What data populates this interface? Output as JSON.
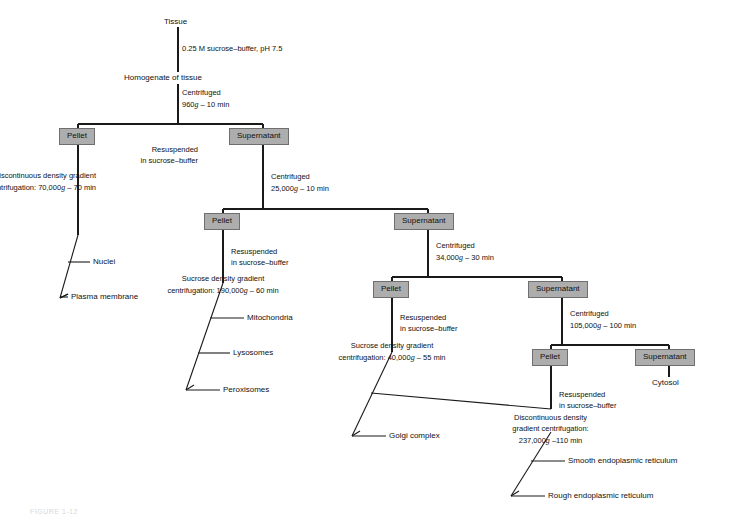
{
  "diagram": {
    "colors": {
      "box_fill": "#adadad",
      "box_border": "#6f6f6f",
      "line": "#1a1a1a",
      "text": "#111111",
      "background": "#ffffff"
    },
    "start_label": "Tissue",
    "homogenate_label": "Homogenate of tissue",
    "box_labels": {
      "pellet": "Pellet",
      "supernatant": "Supernatant"
    },
    "steps": {
      "buffer": "0.25 M sucrose–buffer, pH 7.5",
      "resuspend_line1": "Resuspended",
      "resuspend_line2": "in sucrose–buffer",
      "centrifuged_label": "Centrifuged",
      "spin1_value": "960",
      "spin1_time": " – 10 min",
      "spin2_value": "25,000",
      "spin2_time": " – 10 min",
      "spin3_value": "34,000",
      "spin3_time": " – 30 min",
      "spin4_value": "105,000",
      "spin4_time": " – 100 min",
      "grad1_line1": "Discontinuous density gradient",
      "grad1_line2_pre": "centrifugation:  70,000",
      "grad1_line2_post": " – 70 min",
      "grad2_line1": "Sucrose density gradient",
      "grad2_line2_pre": "centrifugation:  190,000",
      "grad2_line2_post": " – 60 min",
      "grad3_line1": "Sucrose density gradient",
      "grad3_line2_pre": "centrifugation:  40,000",
      "grad3_line2_post": " – 55 min",
      "grad4_line1": "Discontinuous density",
      "grad4_line2": "gradient centrifugation:",
      "grad4_line3_pre": "237,000",
      "grad4_line3_post": " –110 min",
      "g_symbol": "g"
    },
    "products": {
      "nuclei": "Nuclei",
      "plasma_membrane": "Plasma membrane",
      "mitochondria": "Mitochondria",
      "lysosomes": "Lysosomes",
      "peroxisomes": "Peroxisomes",
      "golgi": "Golgi complex",
      "cytosol": "Cytosol",
      "smooth_er": "Smooth endoplasmic reticulum",
      "rough_er": "Rough endoplasmic reticulum"
    },
    "figure_caption": "FIGURE 1-12"
  }
}
